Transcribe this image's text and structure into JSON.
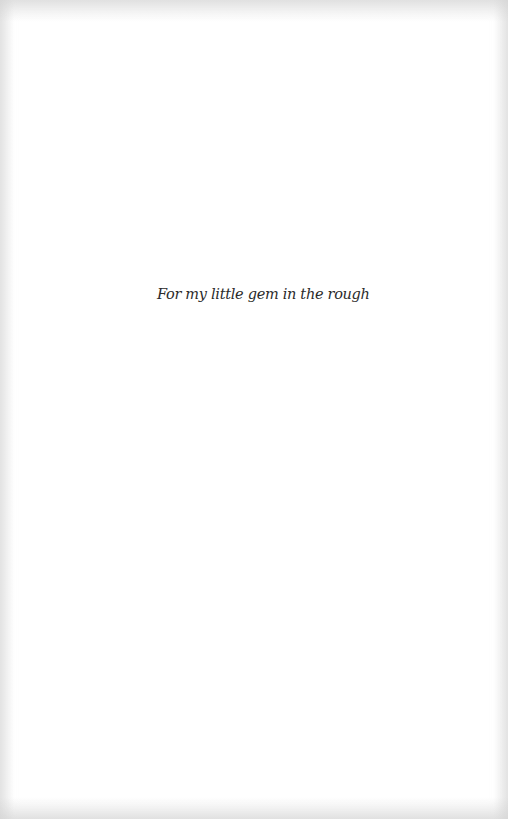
{
  "page": {
    "dedication": "For my little gem in the rough"
  }
}
